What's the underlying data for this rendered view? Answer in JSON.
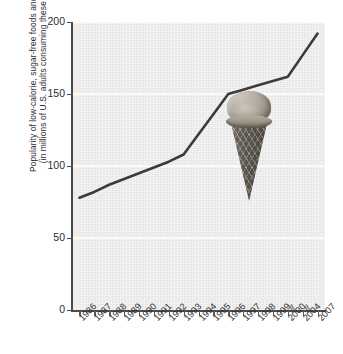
{
  "chart_data": {
    "type": "line",
    "title": "",
    "xlabel": "",
    "ylabel": "Popularity of low-calorie, sugar-free foods and beverages (in millions of U.S. adults consuming these products)",
    "ylabel_line1": "Popularity of low-calorie, sugar-free foods and beverages",
    "ylabel_line2": "(in millions of U.S. adults consuming these products)",
    "ylim": [
      0,
      200
    ],
    "yticks": [
      0,
      50,
      100,
      150,
      200
    ],
    "ytick_labels": [
      "0",
      "50",
      "100",
      "150",
      "200"
    ],
    "grid": true,
    "grid_color": "#fbfbfb",
    "plot_background": "#ececec",
    "line_color": "#3b3b3b",
    "legend": "none",
    "categories": [
      "1986",
      "1987",
      "1988",
      "1989",
      "1990",
      "1991",
      "1992",
      "1993",
      "1994",
      "1995",
      "1996",
      "1997",
      "1998",
      "1999",
      "2000",
      "2004",
      "2007"
    ],
    "values": [
      78,
      82,
      87,
      91,
      95,
      99,
      103,
      108,
      122,
      136,
      150,
      153,
      156,
      159,
      162,
      177,
      192
    ],
    "axis_breaks": [
      "2000|2004",
      "2004|2007"
    ],
    "axis_break_glyph": "//",
    "annotations": [
      {
        "name": "ice-cream-cone-photo",
        "near_category": "1997",
        "description": "photographic ice cream cone overlay"
      }
    ]
  }
}
